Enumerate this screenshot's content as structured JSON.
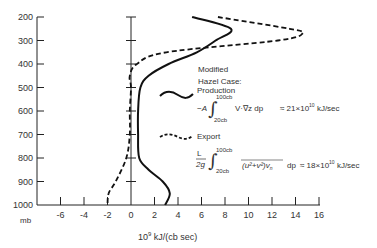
{
  "chart_data": {
    "type": "line",
    "title": "",
    "xlabel": "10^9 kJ/(cb sec)",
    "ylabel": "mb",
    "xlim": [
      -8,
      16
    ],
    "ylim": [
      1000,
      200
    ],
    "x_ticks": [
      -6,
      -4,
      -2,
      0,
      2,
      4,
      6,
      8,
      10,
      12,
      14,
      16
    ],
    "y_ticks": [
      200,
      300,
      400,
      500,
      600,
      700,
      800,
      900,
      1000
    ],
    "grid": false,
    "legend_title": [
      "Modified",
      "Hazel Case:"
    ],
    "series": [
      {
        "name": "Production",
        "style": "solid",
        "formula": "-A ∫ 20cb..100cb V·∇z dp ≈ 21×10^10 kJ/sec",
        "pressure": [
          200,
          250,
          300,
          350,
          400,
          450,
          500,
          600,
          700,
          800,
          850,
          900,
          950,
          1000
        ],
        "values": [
          5.2,
          8.5,
          7.2,
          5.6,
          3.2,
          1.5,
          0.8,
          0.6,
          0.6,
          0.7,
          1.5,
          2.7,
          3.3,
          2.9
        ]
      },
      {
        "name": "Export",
        "style": "dashed",
        "formula": "L/2g ∫ 20cb..100cb (u²+v²)v_n dp ≈ 18×10^10 kJ/sec",
        "pressure": [
          200,
          250,
          270,
          300,
          350,
          400,
          450,
          500,
          600,
          700,
          800,
          900,
          950,
          1000
        ],
        "values": [
          7.4,
          13.5,
          14.6,
          12.5,
          3.0,
          0.5,
          -0.1,
          0.0,
          -0.1,
          -0.1,
          -0.4,
          -1.3,
          -1.9,
          -2.0
        ]
      }
    ]
  },
  "axis": {
    "y_unit": "mb",
    "x_unit_prefix": "10",
    "x_unit_exp": "9",
    "x_unit_rest": " kJ/(cb sec)"
  },
  "legend": {
    "title_line1": "Modified",
    "title_line2": "Hazel Case:",
    "production": {
      "label": "Production",
      "prefix": "−A",
      "upper": "100cb",
      "lower": "20cb",
      "integrand": "V·∇z  dp",
      "result": "≈ 21×10",
      "result_exp": "10",
      "result_unit": " kJ/sec"
    },
    "export": {
      "label": "Export",
      "frac_num": "L",
      "frac_den": "2g",
      "upper": "100cb",
      "lower": "20cb",
      "integrand": "(u²+v²)v",
      "integrand_sub": "n",
      "dp": "dp",
      "result": "≈ 18×10",
      "result_exp": "10",
      "result_unit": " kJ/sec"
    }
  }
}
